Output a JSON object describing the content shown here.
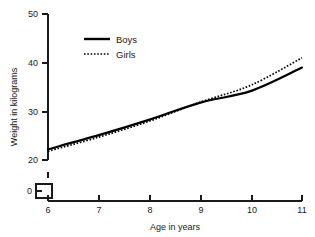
{
  "chart_data": {
    "type": "line",
    "title": "",
    "xlabel": "Age in years",
    "ylabel": "Weight in kilograms",
    "x": [
      6,
      7,
      8,
      9,
      10,
      11
    ],
    "xticklabels": [
      "6",
      "7",
      "8",
      "9",
      "10",
      "11"
    ],
    "yticklabels": [
      "0",
      "20",
      "30",
      "40",
      "50"
    ],
    "yticks": [
      0,
      20,
      30,
      40,
      50
    ],
    "xlim": [
      6,
      11
    ],
    "ylim": [
      20,
      50
    ],
    "y_axis_break": true,
    "y_axis_break_note": "axis broken between 0 and 20",
    "grid": false,
    "legend_position": "upper-left-inside",
    "series": [
      {
        "name": "Boys",
        "style": "solid",
        "color": "#000000",
        "values": [
          22.2,
          25.1,
          28.3,
          31.8,
          34.2,
          39.0
        ]
      },
      {
        "name": "Girls",
        "style": "dotted",
        "color": "#000000",
        "values": [
          21.8,
          24.7,
          28.0,
          31.9,
          35.4,
          41.0
        ]
      }
    ]
  },
  "legend": {
    "items": [
      {
        "label": "Boys"
      },
      {
        "label": "Girls"
      }
    ]
  },
  "axes": {
    "x_title": "Age in years",
    "y_title": "Weight in kilograms",
    "x_ticks": [
      "6",
      "7",
      "8",
      "9",
      "10",
      "11"
    ],
    "y_ticks": [
      "50",
      "40",
      "30",
      "20",
      "0"
    ]
  }
}
